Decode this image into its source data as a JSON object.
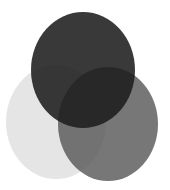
{
  "diagram": {
    "type": "venn",
    "background": "#ffffff",
    "circles": [
      {
        "name": "left",
        "cx": 56,
        "cy": 122,
        "rx": 50,
        "ry": 57,
        "color": "#dcdcdc",
        "opacity": 0.75
      },
      {
        "name": "right",
        "cx": 108,
        "cy": 124,
        "rx": 50,
        "ry": 57,
        "color": "#555555",
        "opacity": 0.8
      },
      {
        "name": "top",
        "cx": 83,
        "cy": 70,
        "rx": 52,
        "ry": 58,
        "color": "#1e1e1e",
        "opacity": 0.88
      }
    ]
  }
}
